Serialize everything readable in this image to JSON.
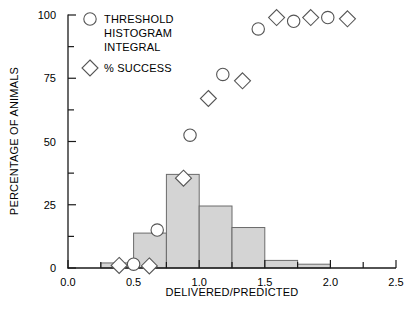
{
  "chart_data": {
    "type": "bar",
    "title": "",
    "xlabel": "DELIVERED/PREDICTED",
    "ylabel": "PERCENTAGE OF ANIMALS",
    "xlim": [
      0.0,
      2.5
    ],
    "ylim": [
      0,
      100
    ],
    "grid": false,
    "xticks": [
      0.0,
      0.5,
      1.0,
      1.5,
      2.0,
      2.5
    ],
    "xtick_labels": [
      "0.0",
      "0.5",
      "1.0",
      "1.5",
      "2.0",
      "2.5"
    ],
    "xminor_ticks": [
      0.25,
      0.75,
      1.25,
      1.75,
      2.25
    ],
    "yticks": [
      0,
      25,
      50,
      75,
      100
    ],
    "ytick_labels": [
      "0",
      "25",
      "50",
      "75",
      "100"
    ],
    "yminor_ticks": [
      12.5,
      37.5,
      62.5,
      87.5
    ],
    "bar_color": "#d4d4d4",
    "bar_edge_color": "#6b6b6b",
    "marker_edge_color": "#555555",
    "bins": [
      {
        "x0": 0.25,
        "x1": 0.5,
        "value": 2.0
      },
      {
        "x0": 0.5,
        "x1": 0.75,
        "value": 13.8
      },
      {
        "x0": 0.75,
        "x1": 1.0,
        "value": 37.0
      },
      {
        "x0": 1.0,
        "x1": 1.25,
        "value": 24.5
      },
      {
        "x0": 1.25,
        "x1": 1.5,
        "value": 16.0
      },
      {
        "x0": 1.5,
        "x1": 1.75,
        "value": 3.0
      },
      {
        "x0": 1.75,
        "x1": 2.0,
        "value": 1.5
      }
    ],
    "series": [
      {
        "name": "THRESHOLD HISTOGRAM INTEGRAL",
        "marker": "circle",
        "points": [
          {
            "x": 0.5,
            "y": 1.5
          },
          {
            "x": 0.68,
            "y": 15.0
          },
          {
            "x": 0.93,
            "y": 52.5
          },
          {
            "x": 1.18,
            "y": 76.5
          },
          {
            "x": 1.45,
            "y": 94.5
          },
          {
            "x": 1.72,
            "y": 97.5
          },
          {
            "x": 1.98,
            "y": 99.0
          }
        ]
      },
      {
        "name": "% SUCCESS",
        "marker": "diamond",
        "points": [
          {
            "x": 0.39,
            "y": 1.0
          },
          {
            "x": 0.62,
            "y": 0.8
          },
          {
            "x": 0.88,
            "y": 35.5
          },
          {
            "x": 1.07,
            "y": 67.0
          },
          {
            "x": 1.33,
            "y": 74.0
          },
          {
            "x": 1.59,
            "y": 99.0
          },
          {
            "x": 1.85,
            "y": 99.0
          },
          {
            "x": 2.13,
            "y": 98.5
          }
        ]
      }
    ]
  },
  "legend": {
    "entries": [
      {
        "marker": "circle",
        "lines": [
          "THRESHOLD",
          "HISTOGRAM",
          "INTEGRAL"
        ]
      },
      {
        "marker": "diamond",
        "lines": [
          "% SUCCESS"
        ]
      }
    ],
    "line1": "THRESHOLD",
    "line2": "HISTOGRAM",
    "line3": "INTEGRAL",
    "line4": "% SUCCESS"
  },
  "axes": {
    "x_title": "DELIVERED/PREDICTED",
    "y_title": "PERCENTAGE OF ANIMALS",
    "x_labels": [
      "0.0",
      "0.5",
      "1.0",
      "1.5",
      "2.0",
      "2.5"
    ],
    "y_labels": [
      "0",
      "25",
      "50",
      "75",
      "100"
    ]
  }
}
